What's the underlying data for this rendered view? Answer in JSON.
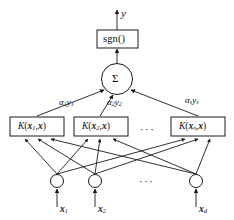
{
  "figure": {
    "colors": {
      "stroke": "#1a1a1a",
      "background": "#ffffff",
      "text": "#111111"
    },
    "output": {
      "label": "y"
    },
    "decision_node": {
      "label": "sgn()"
    },
    "sum_node": {
      "label": "Σ"
    },
    "weights": [
      {
        "alpha": "α",
        "alpha_sub": "1",
        "y": "y",
        "y_sub": "1"
      },
      {
        "alpha": "α",
        "alpha_sub": "2",
        "y": "y",
        "y_sub": "2"
      },
      {
        "alpha": "α",
        "alpha_sub": "s",
        "y": "y",
        "y_sub": "s"
      }
    ],
    "kernels": [
      {
        "fn": "K",
        "open": "(",
        "arg": "x",
        "arg_sub": "1",
        "comma": ",",
        "arg2": "x",
        "close": ")"
      },
      {
        "fn": "K",
        "open": "(",
        "arg": "x",
        "arg_sub": "2",
        "comma": ",",
        "arg2": "x",
        "close": ")"
      },
      {
        "fn": "K",
        "open": "(",
        "arg": "x",
        "arg_sub": "s",
        "comma": ",",
        "arg2": "x",
        "close": ")"
      }
    ],
    "kernel_ellipsis": "···",
    "inputs": [
      {
        "label": "x",
        "sub": "1"
      },
      {
        "label": "x",
        "sub": "2"
      },
      {
        "label": "x",
        "sub": "d"
      }
    ],
    "input_ellipsis": "···"
  }
}
